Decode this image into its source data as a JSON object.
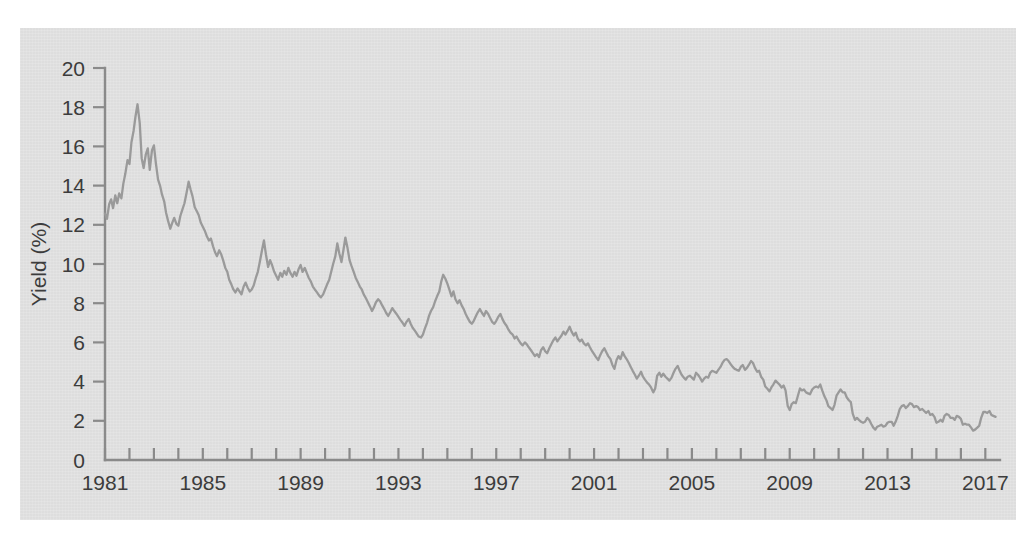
{
  "chart_data": {
    "type": "line",
    "title": "",
    "subtitle": "",
    "xlabel": "",
    "ylabel": "Yield (%)",
    "xlim": [
      1981,
      2017.6
    ],
    "ylim": [
      0,
      20
    ],
    "grid": false,
    "legend": null,
    "annotations": [],
    "y_ticks": [
      0,
      2,
      4,
      6,
      8,
      10,
      12,
      14,
      16,
      18,
      20
    ],
    "y_tick_labels": [
      "0",
      "2",
      "4",
      "6",
      "8",
      "10",
      "12",
      "14",
      "16",
      "18",
      "20"
    ],
    "x_tick_labels": [
      "1981",
      "1985",
      "1989",
      "1993",
      "1997",
      "2001",
      "2005",
      "2009",
      "2013",
      "2017"
    ],
    "x_labeled_ticks": [
      1981,
      1985,
      1989,
      1993,
      1997,
      2001,
      2005,
      2009,
      2013,
      2017
    ],
    "x_minor_ticks": [
      1981,
      1982,
      1983,
      1984,
      1985,
      1986,
      1987,
      1988,
      1989,
      1990,
      1991,
      1992,
      1993,
      1994,
      1995,
      1996,
      1997,
      1998,
      1999,
      2000,
      2001,
      2002,
      2003,
      2004,
      2005,
      2006,
      2007,
      2008,
      2009,
      2010,
      2011,
      2012,
      2013,
      2014,
      2015,
      2016,
      2017
    ],
    "series": [
      {
        "name": "Yield",
        "color": "#9a9a9a",
        "x": [
          1981.0,
          1981.08,
          1981.17,
          1981.25,
          1981.33,
          1981.42,
          1981.5,
          1981.58,
          1981.67,
          1981.75,
          1981.83,
          1981.92,
          1982.0,
          1982.08,
          1982.17,
          1982.25,
          1982.33,
          1982.42,
          1982.5,
          1982.58,
          1982.67,
          1982.75,
          1982.83,
          1982.92,
          1983.0,
          1983.08,
          1983.17,
          1983.25,
          1983.33,
          1983.42,
          1983.5,
          1983.58,
          1983.67,
          1983.75,
          1983.83,
          1983.92,
          1984.0,
          1984.08,
          1984.17,
          1984.25,
          1984.33,
          1984.42,
          1984.5,
          1984.58,
          1984.67,
          1984.75,
          1984.83,
          1984.92,
          1985.0,
          1985.08,
          1985.17,
          1985.25,
          1985.33,
          1985.42,
          1985.5,
          1985.58,
          1985.67,
          1985.75,
          1985.83,
          1985.92,
          1986.0,
          1986.08,
          1986.17,
          1986.25,
          1986.33,
          1986.42,
          1986.5,
          1986.58,
          1986.67,
          1986.75,
          1986.83,
          1986.92,
          1987.0,
          1987.08,
          1987.17,
          1987.25,
          1987.33,
          1987.42,
          1987.5,
          1987.58,
          1987.67,
          1987.75,
          1987.83,
          1987.92,
          1988.0,
          1988.08,
          1988.17,
          1988.25,
          1988.33,
          1988.42,
          1988.5,
          1988.58,
          1988.67,
          1988.75,
          1988.83,
          1988.92,
          1989.0,
          1989.08,
          1989.17,
          1989.25,
          1989.33,
          1989.42,
          1989.5,
          1989.58,
          1989.67,
          1989.75,
          1989.83,
          1989.92,
          1990.0,
          1990.08,
          1990.17,
          1990.25,
          1990.33,
          1990.42,
          1990.5,
          1990.58,
          1990.67,
          1990.75,
          1990.83,
          1990.92,
          1991.0,
          1991.08,
          1991.17,
          1991.25,
          1991.33,
          1991.42,
          1991.5,
          1991.58,
          1991.67,
          1991.75,
          1991.83,
          1991.92,
          1992.0,
          1992.08,
          1992.17,
          1992.25,
          1992.33,
          1992.42,
          1992.5,
          1992.58,
          1992.67,
          1992.75,
          1992.83,
          1992.92,
          1993.0,
          1993.08,
          1993.17,
          1993.25,
          1993.33,
          1993.42,
          1993.5,
          1993.58,
          1993.67,
          1993.75,
          1993.83,
          1993.92,
          1994.0,
          1994.08,
          1994.17,
          1994.25,
          1994.33,
          1994.42,
          1994.5,
          1994.58,
          1994.67,
          1994.75,
          1994.83,
          1994.92,
          1995.0,
          1995.08,
          1995.17,
          1995.25,
          1995.33,
          1995.42,
          1995.5,
          1995.58,
          1995.67,
          1995.75,
          1995.83,
          1995.92,
          1996.0,
          1996.08,
          1996.17,
          1996.25,
          1996.33,
          1996.42,
          1996.5,
          1996.58,
          1996.67,
          1996.75,
          1996.83,
          1996.92,
          1997.0,
          1997.08,
          1997.17,
          1997.25,
          1997.33,
          1997.42,
          1997.5,
          1997.58,
          1997.67,
          1997.75,
          1997.83,
          1997.92,
          1998.0,
          1998.08,
          1998.17,
          1998.25,
          1998.33,
          1998.42,
          1998.5,
          1998.58,
          1998.67,
          1998.75,
          1998.83,
          1998.92,
          1999.0,
          1999.08,
          1999.17,
          1999.25,
          1999.33,
          1999.42,
          1999.5,
          1999.58,
          1999.67,
          1999.75,
          1999.83,
          1999.92,
          2000.0,
          2000.08,
          2000.17,
          2000.25,
          2000.33,
          2000.42,
          2000.5,
          2000.58,
          2000.67,
          2000.75,
          2000.83,
          2000.92,
          2001.0,
          2001.08,
          2001.17,
          2001.25,
          2001.33,
          2001.42,
          2001.5,
          2001.58,
          2001.67,
          2001.75,
          2001.83,
          2001.92,
          2002.0,
          2002.08,
          2002.17,
          2002.25,
          2002.33,
          2002.42,
          2002.5,
          2002.58,
          2002.67,
          2002.75,
          2002.83,
          2002.92,
          2003.0,
          2003.08,
          2003.17,
          2003.25,
          2003.33,
          2003.42,
          2003.5,
          2003.58,
          2003.67,
          2003.75,
          2003.83,
          2003.92,
          2004.0,
          2004.08,
          2004.17,
          2004.25,
          2004.33,
          2004.42,
          2004.5,
          2004.58,
          2004.67,
          2004.75,
          2004.83,
          2004.92,
          2005.0,
          2005.08,
          2005.17,
          2005.25,
          2005.33,
          2005.42,
          2005.5,
          2005.58,
          2005.67,
          2005.75,
          2005.83,
          2005.92,
          2006.0,
          2006.08,
          2006.17,
          2006.25,
          2006.33,
          2006.42,
          2006.5,
          2006.58,
          2006.67,
          2006.75,
          2006.83,
          2006.92,
          2007.0,
          2007.08,
          2007.17,
          2007.25,
          2007.33,
          2007.42,
          2007.5,
          2007.58,
          2007.67,
          2007.75,
          2007.83,
          2007.92,
          2008.0,
          2008.08,
          2008.17,
          2008.25,
          2008.33,
          2008.42,
          2008.5,
          2008.58,
          2008.67,
          2008.75,
          2008.83,
          2008.92,
          2009.0,
          2009.08,
          2009.17,
          2009.25,
          2009.33,
          2009.42,
          2009.5,
          2009.58,
          2009.67,
          2009.75,
          2009.83,
          2009.92,
          2010.0,
          2010.08,
          2010.17,
          2010.25,
          2010.33,
          2010.42,
          2010.5,
          2010.58,
          2010.67,
          2010.75,
          2010.83,
          2010.92,
          2011.0,
          2011.08,
          2011.17,
          2011.25,
          2011.33,
          2011.42,
          2011.5,
          2011.58,
          2011.67,
          2011.75,
          2011.83,
          2011.92,
          2012.0,
          2012.08,
          2012.17,
          2012.25,
          2012.33,
          2012.42,
          2012.5,
          2012.58,
          2012.67,
          2012.75,
          2012.83,
          2012.92,
          2013.0,
          2013.08,
          2013.17,
          2013.25,
          2013.33,
          2013.42,
          2013.5,
          2013.58,
          2013.67,
          2013.75,
          2013.83,
          2013.92,
          2014.0,
          2014.08,
          2014.17,
          2014.25,
          2014.33,
          2014.42,
          2014.5,
          2014.58,
          2014.67,
          2014.75,
          2014.83,
          2014.92,
          2015.0,
          2015.08,
          2015.17,
          2015.25,
          2015.33,
          2015.42,
          2015.5,
          2015.58,
          2015.67,
          2015.75,
          2015.83,
          2015.92,
          2016.0,
          2016.08,
          2016.17,
          2016.25,
          2016.33,
          2016.42,
          2016.5,
          2016.58,
          2016.67,
          2016.75,
          2016.83,
          2016.92,
          2017.0,
          2017.08,
          2017.17,
          2017.25,
          2017.33,
          2017.42
        ],
        "y": [
          12.57,
          12.3,
          13.05,
          13.3,
          12.85,
          13.5,
          13.1,
          13.6,
          13.35,
          14.1,
          14.6,
          15.3,
          15.1,
          16.2,
          16.8,
          17.55,
          18.15,
          17.2,
          15.4,
          14.9,
          15.6,
          15.9,
          14.8,
          15.8,
          16.05,
          15.15,
          14.3,
          14.0,
          13.55,
          13.2,
          12.6,
          12.2,
          11.8,
          12.1,
          12.35,
          12.05,
          11.95,
          12.45,
          12.8,
          13.1,
          13.6,
          14.2,
          13.8,
          13.45,
          12.9,
          12.7,
          12.5,
          12.1,
          11.9,
          11.7,
          11.4,
          11.2,
          11.3,
          10.9,
          10.6,
          10.4,
          10.7,
          10.5,
          10.2,
          9.8,
          9.6,
          9.2,
          8.95,
          8.7,
          8.55,
          8.75,
          8.6,
          8.45,
          8.85,
          9.05,
          8.8,
          8.6,
          8.7,
          8.9,
          9.3,
          9.6,
          10.1,
          10.7,
          11.2,
          10.5,
          9.85,
          10.2,
          9.95,
          9.6,
          9.4,
          9.2,
          9.55,
          9.35,
          9.65,
          9.45,
          9.8,
          9.55,
          9.35,
          9.6,
          9.4,
          9.75,
          9.95,
          9.6,
          9.8,
          9.55,
          9.3,
          9.1,
          8.85,
          8.7,
          8.55,
          8.4,
          8.3,
          8.45,
          8.7,
          8.95,
          9.2,
          9.6,
          10.0,
          10.4,
          11.05,
          10.55,
          10.1,
          10.7,
          11.35,
          10.8,
          10.2,
          9.9,
          9.6,
          9.3,
          9.1,
          8.85,
          8.7,
          8.45,
          8.25,
          8.05,
          7.85,
          7.6,
          7.8,
          8.05,
          8.2,
          8.1,
          7.9,
          7.7,
          7.5,
          7.35,
          7.55,
          7.75,
          7.6,
          7.45,
          7.3,
          7.15,
          7.0,
          6.85,
          7.05,
          7.2,
          6.95,
          6.75,
          6.6,
          6.45,
          6.3,
          6.25,
          6.4,
          6.7,
          7.0,
          7.35,
          7.6,
          7.8,
          8.1,
          8.35,
          8.6,
          9.1,
          9.45,
          9.25,
          9.0,
          8.7,
          8.35,
          8.6,
          8.2,
          8.0,
          8.15,
          7.9,
          7.7,
          7.45,
          7.25,
          7.05,
          6.95,
          7.1,
          7.35,
          7.55,
          7.7,
          7.5,
          7.35,
          7.6,
          7.45,
          7.25,
          7.05,
          6.95,
          7.1,
          7.3,
          7.45,
          7.2,
          7.0,
          6.85,
          6.65,
          6.5,
          6.4,
          6.2,
          6.3,
          6.1,
          5.95,
          5.85,
          6.0,
          5.9,
          5.75,
          5.6,
          5.45,
          5.3,
          5.4,
          5.25,
          5.6,
          5.75,
          5.55,
          5.45,
          5.7,
          5.9,
          6.1,
          6.25,
          6.05,
          6.2,
          6.35,
          6.55,
          6.4,
          6.6,
          6.8,
          6.55,
          6.35,
          6.5,
          6.2,
          6.05,
          6.15,
          5.95,
          5.85,
          5.95,
          5.75,
          5.55,
          5.4,
          5.25,
          5.1,
          5.35,
          5.55,
          5.7,
          5.5,
          5.3,
          5.15,
          4.85,
          4.65,
          5.1,
          5.3,
          5.15,
          5.5,
          5.3,
          5.15,
          4.95,
          4.75,
          4.55,
          4.35,
          4.15,
          4.3,
          4.5,
          4.25,
          4.1,
          3.95,
          3.85,
          3.7,
          3.45,
          3.65,
          4.3,
          4.45,
          4.25,
          4.4,
          4.25,
          4.15,
          4.05,
          4.2,
          4.45,
          4.65,
          4.8,
          4.55,
          4.35,
          4.2,
          4.1,
          4.25,
          4.3,
          4.2,
          4.1,
          4.45,
          4.35,
          4.2,
          4.0,
          4.15,
          4.25,
          4.2,
          4.45,
          4.55,
          4.5,
          4.45,
          4.6,
          4.75,
          4.95,
          5.1,
          5.15,
          5.05,
          4.9,
          4.75,
          4.65,
          4.6,
          4.55,
          4.75,
          4.85,
          4.6,
          4.7,
          4.85,
          5.05,
          4.95,
          4.7,
          4.5,
          4.55,
          4.25,
          4.1,
          3.75,
          3.65,
          3.5,
          3.7,
          3.85,
          4.05,
          3.95,
          3.85,
          3.7,
          3.8,
          3.55,
          2.75,
          2.55,
          2.85,
          2.95,
          2.9,
          3.25,
          3.65,
          3.55,
          3.6,
          3.45,
          3.4,
          3.35,
          3.6,
          3.7,
          3.75,
          3.7,
          3.85,
          3.55,
          3.25,
          3.05,
          2.75,
          2.65,
          2.55,
          2.8,
          3.3,
          3.45,
          3.6,
          3.45,
          3.45,
          3.2,
          3.05,
          2.95,
          2.35,
          2.05,
          2.15,
          2.05,
          1.95,
          1.9,
          1.95,
          2.15,
          2.05,
          1.85,
          1.65,
          1.55,
          1.7,
          1.75,
          1.8,
          1.7,
          1.75,
          1.9,
          1.95,
          1.95,
          1.75,
          1.95,
          2.25,
          2.6,
          2.75,
          2.8,
          2.65,
          2.75,
          2.9,
          2.85,
          2.7,
          2.75,
          2.7,
          2.55,
          2.6,
          2.5,
          2.4,
          2.5,
          2.3,
          2.35,
          2.2,
          1.9,
          1.95,
          2.05,
          1.95,
          2.25,
          2.35,
          2.3,
          2.15,
          2.15,
          2.05,
          2.25,
          2.2,
          2.1,
          1.8,
          1.85,
          1.8,
          1.8,
          1.65,
          1.5,
          1.55,
          1.65,
          1.75,
          2.15,
          2.45,
          2.45,
          2.4,
          2.5,
          2.3,
          2.25,
          2.2
        ]
      }
    ]
  },
  "axes": {
    "ylabel": "Yield (%)",
    "y_tick_labels": [
      "0",
      "2",
      "4",
      "6",
      "8",
      "10",
      "12",
      "14",
      "16",
      "18",
      "20"
    ],
    "x_tick_labels": [
      "1981",
      "1985",
      "1989",
      "1993",
      "1997",
      "2001",
      "2005",
      "2009",
      "2013",
      "2017"
    ]
  },
  "style": {
    "panel_background": "#e2e2e2",
    "page_background": "#ffffff",
    "line_color": "#9a9a9a",
    "axis_color": "#8a8a8a",
    "text_color": "#3c3c3c"
  }
}
